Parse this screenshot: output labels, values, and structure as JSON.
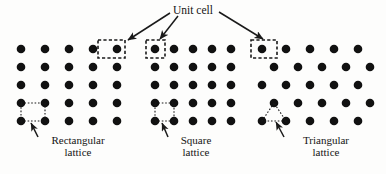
{
  "figure": {
    "title_label": "Unit cell",
    "background": "#fdfdfc",
    "dot_color": "#111111",
    "line_color": "#1a1a1a"
  },
  "captions": {
    "rectangular": {
      "line1": "Rectangular",
      "line2": "lattice"
    },
    "square": {
      "line1": "Square",
      "line2": "lattice"
    },
    "triangular": {
      "line1": "Triangular",
      "line2": "lattice"
    }
  },
  "chart_data": {
    "type": "scatter",
    "title": "Unit cell",
    "xlabel": "",
    "ylabel": "",
    "groups": [
      {
        "name": "rectangular",
        "caption": "Rectangular lattice",
        "lattice_type": "rectangular",
        "columns": 5,
        "rows": 5,
        "x_spacing": 24,
        "y_spacing": 18,
        "row_offset": 0,
        "origin_x": 21,
        "origin_y": 49,
        "dot_radius": 4.3,
        "unit_cell_marker": {
          "shape": "rect",
          "x": 98,
          "y": 40,
          "width": 27,
          "height": 18,
          "style": "dashed"
        },
        "unit_cell_outline": {
          "shape": "rect",
          "x": 21,
          "y": 103,
          "width": 24,
          "height": 18,
          "style": "dotted"
        },
        "caption_arrow": {
          "x1": 38,
          "y1": 137,
          "x2": 31,
          "y2": 123
        }
      },
      {
        "name": "square",
        "caption": "Square lattice",
        "lattice_type": "square",
        "columns": 5,
        "rows": 5,
        "x_spacing": 19,
        "y_spacing": 18,
        "row_offset": 0,
        "origin_x": 155,
        "origin_y": 49,
        "dot_radius": 4.3,
        "unit_cell_marker": {
          "shape": "rect",
          "x": 146,
          "y": 40,
          "width": 19,
          "height": 18,
          "style": "dashed"
        },
        "unit_cell_outline": {
          "shape": "rect",
          "x": 155,
          "y": 103,
          "width": 19,
          "height": 18,
          "style": "dotted"
        },
        "caption_arrow": {
          "x1": 168,
          "y1": 137,
          "x2": 162,
          "y2": 123
        }
      },
      {
        "name": "triangular",
        "caption": "Triangular lattice",
        "lattice_type": "triangular",
        "columns": 5,
        "rows": 5,
        "x_spacing": 24,
        "y_spacing": 18,
        "row_offset": 12,
        "origin_x": 262,
        "origin_y": 49,
        "dot_radius": 4.3,
        "unit_cell_marker": {
          "shape": "rect",
          "x": 251,
          "y": 40,
          "width": 26,
          "height": 18,
          "style": "dashed"
        },
        "unit_cell_outline": {
          "shape": "triangle",
          "points": "274,103 262,121 286,121",
          "style": "dotted"
        },
        "caption_arrow": {
          "x1": 284,
          "y1": 137,
          "x2": 276,
          "y2": 122
        }
      }
    ],
    "title_arrows": [
      {
        "name": "arrow-to-rectangular",
        "x1": 170,
        "y1": 13,
        "x2": 128,
        "y2": 40
      },
      {
        "name": "arrow-to-square",
        "x1": 178,
        "y1": 16,
        "x2": 160,
        "y2": 39
      },
      {
        "name": "arrow-to-triangular",
        "x1": 219,
        "y1": 12,
        "x2": 263,
        "y2": 39
      }
    ],
    "title_position": {
      "x": 195,
      "y": 11
    },
    "caption_positions": [
      {
        "name": "rectangular",
        "x": 78,
        "y": 140
      },
      {
        "name": "square",
        "x": 196,
        "y": 140
      },
      {
        "name": "triangular",
        "x": 325,
        "y": 140
      }
    ]
  }
}
